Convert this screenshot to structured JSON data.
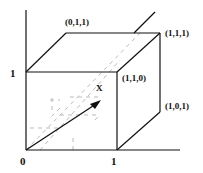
{
  "diagram": {
    "type": "unit-cube-3d",
    "axes": {
      "origin_label": "0",
      "x_tick_label": "1",
      "y_tick_label": "1"
    },
    "vertex_labels": {
      "v011": "(0,1,1)",
      "v111": "(1,1,1)",
      "v110": "(1,1,0)",
      "v101": "(1,0,1)"
    },
    "vector": {
      "label": "X",
      "from": [
        26,
        150
      ],
      "to": [
        100,
        101
      ]
    },
    "colors": {
      "line": "#111111",
      "hidden": "#bbbbbb",
      "text": "#111111"
    }
  }
}
